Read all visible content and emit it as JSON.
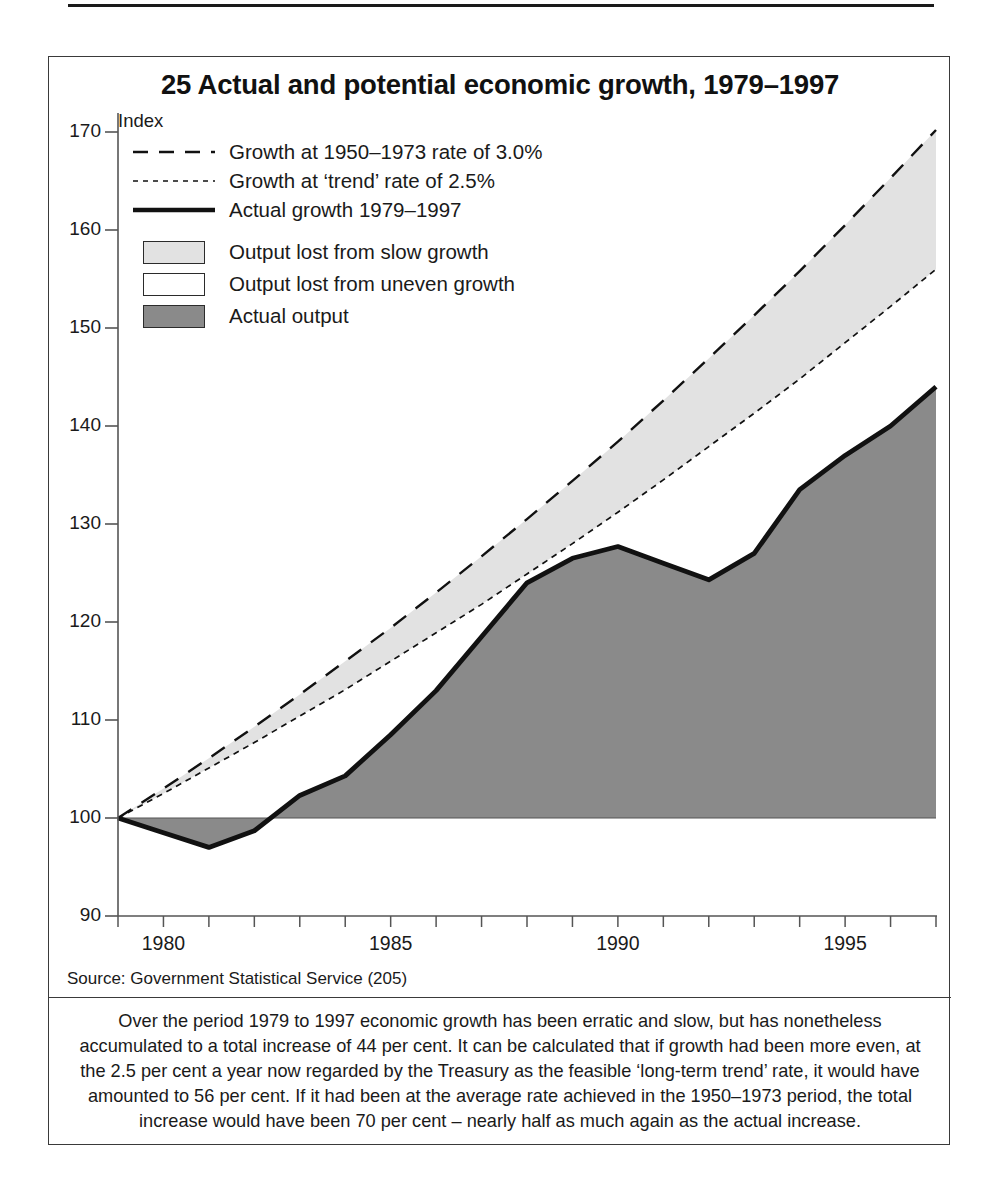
{
  "running_head": "Britain's Future: Issues and Choices",
  "figure": {
    "title": "25 Actual and potential economic growth, 1979–1997",
    "index_label": "Index",
    "source": "Source: Government Statistical Service (205)",
    "note": "Over the period 1979 to 1997 economic growth has been erratic and slow, but has nonetheless accumulated to a total increase of 44 per cent. It can be calculated that if growth had been more even, at the 2.5 per cent a year now regarded by the Treasury as the feasible ‘long-term trend’ rate, it would have amounted to 56 per cent. If it had been at the average rate achieved in the 1950–1973 period, the total increase would have been 70 per cent – nearly half as much again as the actual increase."
  },
  "legend": {
    "lines": [
      {
        "key": "dashed-long",
        "label": "Growth at 1950–1973 rate of 3.0%"
      },
      {
        "key": "dotted-fine",
        "label": "Growth at ‘trend’ rate of 2.5%"
      },
      {
        "key": "solid-thick",
        "label": "Actual growth 1979–1997"
      }
    ],
    "swatches": [
      {
        "key": "light-gray",
        "color": "#e2e2e2",
        "label": "Output lost from slow growth"
      },
      {
        "key": "white",
        "color": "#ffffff",
        "label": "Output lost from uneven growth"
      },
      {
        "key": "dark-gray",
        "color": "#8a8a8a",
        "label": "Actual output"
      }
    ]
  },
  "colors": {
    "slow_growth_fill": "#e2e2e2",
    "uneven_growth_fill": "#ffffff",
    "actual_output_fill": "#8a8a8a",
    "line": "#111111",
    "axis": "#555555",
    "frame": "#3a3a3a"
  },
  "chart_data": {
    "type": "area",
    "title": "25 Actual and potential economic growth, 1979–1997",
    "xlabel": "",
    "ylabel": "Index",
    "xlim": [
      1979,
      1997
    ],
    "ylim": [
      90,
      170
    ],
    "ytick_values": [
      90,
      100,
      110,
      120,
      130,
      140,
      150,
      160,
      170
    ],
    "xtick_values": [
      1979,
      1980,
      1981,
      1982,
      1983,
      1984,
      1985,
      1986,
      1987,
      1988,
      1989,
      1990,
      1991,
      1992,
      1993,
      1994,
      1995,
      1996,
      1997
    ],
    "xtick_labels": [
      "",
      "1980",
      "",
      "",
      "",
      "",
      "1985",
      "",
      "",
      "",
      "",
      "1990",
      "",
      "",
      "",
      "",
      "1995",
      "",
      ""
    ],
    "grid": false,
    "legend_position": "upper-left",
    "baseline": 100,
    "x": [
      1979,
      1980,
      1981,
      1982,
      1983,
      1984,
      1985,
      1986,
      1987,
      1988,
      1989,
      1990,
      1991,
      1992,
      1993,
      1994,
      1995,
      1996,
      1997
    ],
    "series": [
      {
        "name": "Growth at 1950–1973 rate of 3.0%",
        "style": "dashed-long",
        "rate_percent": 3.0,
        "values": [
          100.0,
          103.0,
          106.1,
          109.3,
          112.6,
          116.0,
          119.4,
          123.0,
          126.7,
          130.5,
          134.4,
          138.4,
          142.6,
          146.9,
          151.3,
          155.8,
          160.5,
          165.3,
          170.2
        ]
      },
      {
        "name": "Growth at ‘trend’ rate of 2.5%",
        "style": "dotted-fine",
        "rate_percent": 2.5,
        "values": [
          100.0,
          102.5,
          105.1,
          107.7,
          110.4,
          113.1,
          116.0,
          118.9,
          121.8,
          124.9,
          128.0,
          131.2,
          134.5,
          137.9,
          141.3,
          144.8,
          148.5,
          152.2,
          156.0
        ]
      },
      {
        "name": "Actual growth 1979–1997",
        "style": "solid-thick",
        "values": [
          100.0,
          98.5,
          97.0,
          98.7,
          102.3,
          104.3,
          108.5,
          113.0,
          118.5,
          124.0,
          126.5,
          127.7,
          126.0,
          124.3,
          127.0,
          133.5,
          137.0,
          140.0,
          144.0
        ]
      }
    ],
    "annotations": {
      "total_actual_increase_percent": 44,
      "trend_increase_percent": 56,
      "postwar_rate_increase_percent": 70
    }
  }
}
